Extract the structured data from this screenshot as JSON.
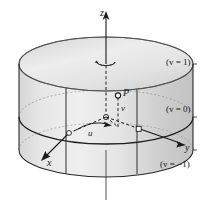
{
  "figure": {
    "kind": "cylinder-coordinate-diagram",
    "background_color": "#ffffff",
    "surface_fill_light": "#e3e3e3",
    "surface_fill_mid": "#d2d2d2",
    "surface_fill_dark": "#bfbfbf",
    "top_cap_fill": "#ededed",
    "line_color": "#1a1a1a",
    "dash_color": "#333333"
  },
  "axes": {
    "z": {
      "label": "z",
      "name": "z-axis"
    },
    "x": {
      "label": "x",
      "name": "x-axis"
    },
    "y": {
      "label": "y",
      "name": "y-axis"
    }
  },
  "point": {
    "label": "P",
    "name": "point-P"
  },
  "parameters": {
    "u": {
      "label": "u",
      "name": "u-parameter-arc"
    },
    "v": {
      "label": "v",
      "name": "v-parameter-segment"
    }
  },
  "isolines": [
    {
      "id": "v-top",
      "prefix": "(",
      "var": "v",
      "eq": " = 1)",
      "full": "(v = 1)"
    },
    {
      "id": "v-middle",
      "prefix": "(",
      "var": "v",
      "eq": " = 0)",
      "full": "(v = 0)"
    },
    {
      "id": "v-bottom",
      "prefix": "(",
      "var": "v",
      "eq": " = −1)",
      "full": "(v = −1)"
    }
  ],
  "rotation_marker": {
    "name": "rotation-arrow-about-z",
    "description": "small circular arrow around z axis at top cap"
  }
}
